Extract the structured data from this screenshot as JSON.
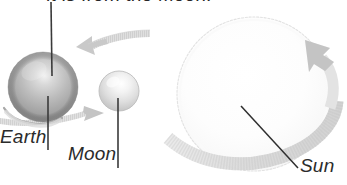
{
  "diagram": {
    "caption_fragment": "it is from the Moon.",
    "background_color": "#ffffff"
  },
  "bodies": [
    {
      "id": "earth",
      "label": "Earth",
      "icon": "earth-sphere-icon",
      "center_x": 43,
      "center_y": 87,
      "radius": 35,
      "fill_color": "#b0b0b0",
      "highlight_color": "#e8e8e8",
      "shade_color": "#8a8a8a"
    },
    {
      "id": "moon",
      "label": "Moon",
      "icon": "moon-sphere-icon",
      "center_x": 119,
      "center_y": 91,
      "radius": 20,
      "fill_color": "#dcdcdc",
      "highlight_color": "#fafafa",
      "shade_color": "#bdbdbd"
    },
    {
      "id": "sun",
      "label": "Sun",
      "icon": "sun-sphere-icon",
      "center_x": 254,
      "center_y": 94,
      "radius": 77,
      "fill_color": "#fbfbfb",
      "highlight_color": "#ffffff",
      "shade_color": "#f0f0f0",
      "outline_color": "#e4e4e4"
    }
  ],
  "arrows": [
    {
      "id": "earth-orbit-arrow-top",
      "name": "earth-rotation-arrow",
      "direction": "left",
      "color": "#d4d4d4"
    },
    {
      "id": "moon-orbit-arrow-bottom",
      "name": "moon-orbit-arrow",
      "direction": "right",
      "color": "#cfcfcf"
    },
    {
      "id": "sun-rotation-arrow",
      "name": "sun-rotation-arrow",
      "direction": "up-left",
      "color": "#dedede"
    }
  ],
  "leader_lines": [
    {
      "id": "caption-to-earth",
      "name": "caption-leader-line",
      "color": "#3a3a3a"
    },
    {
      "id": "earth-label-leader",
      "name": "earth-leader-line",
      "color": "#3a3a3a"
    },
    {
      "id": "moon-label-leader",
      "name": "moon-leader-line",
      "color": "#3a3a3a"
    },
    {
      "id": "sun-label-leader",
      "name": "sun-leader-line",
      "color": "#2f2f2f"
    }
  ],
  "colors": {
    "text": "#2b2b2b",
    "leader": "#3a3a3a",
    "arrow": "#d4d4d4"
  }
}
